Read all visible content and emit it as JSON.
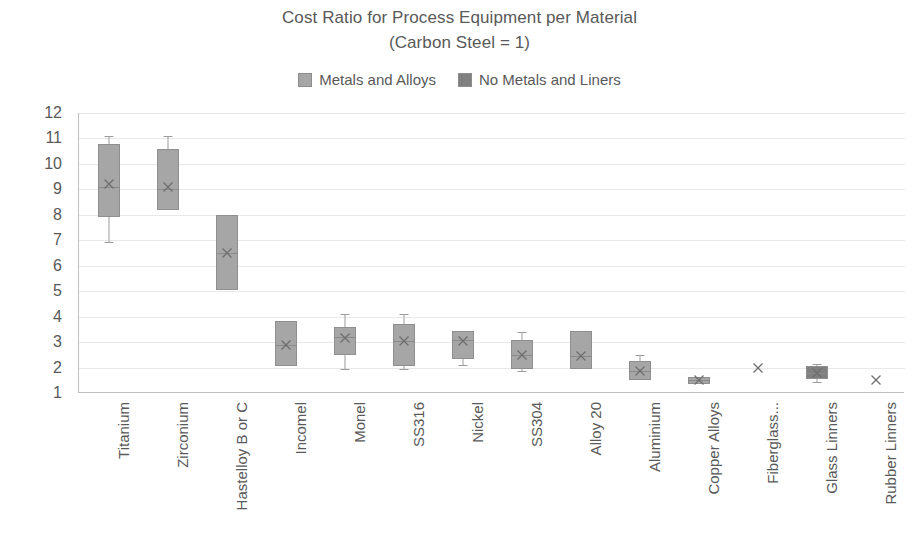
{
  "chart_data": {
    "type": "box",
    "title": "Cost Ratio for Process Equipment per Material",
    "subtitle": "(Carbon Steel = 1)",
    "xlabel": "",
    "ylabel": "",
    "ylim": [
      1,
      12
    ],
    "yticks": [
      1,
      2,
      3,
      4,
      5,
      6,
      7,
      8,
      9,
      10,
      11,
      12
    ],
    "grid": true,
    "legend_position": "top",
    "legend": [
      {
        "label": "Metals and Alloys",
        "color": "#a6a6a6"
      },
      {
        "label": "No Metals and Liners",
        "color": "#808080"
      }
    ],
    "categories": [
      "Titanium",
      "Zirconium",
      "Hastelloy B or C",
      "Incomel",
      "Monel",
      "SS316",
      "Nickel",
      "SS304",
      "Alloy 20",
      "Aluminium",
      "Copper Alloys",
      "Fiberglass...",
      "Glass Linners",
      "Rubber Linners"
    ],
    "boxes": [
      {
        "name": "Titanium",
        "series": "Metals and Alloys",
        "min": 6.95,
        "q1": 7.9,
        "median": 9.1,
        "mean": 9.2,
        "q3": 10.8,
        "max": 11.1
      },
      {
        "name": "Zirconium",
        "series": "Metals and Alloys",
        "min": 8.2,
        "q1": 8.2,
        "median": 9.0,
        "mean": 9.1,
        "q3": 10.6,
        "max": 11.1
      },
      {
        "name": "Hastelloy B or C",
        "series": "Metals and Alloys",
        "min": 5.05,
        "q1": 5.05,
        "median": 6.5,
        "mean": 6.5,
        "q3": 8.0,
        "max": 8.0
      },
      {
        "name": "Incomel",
        "series": "Metals and Alloys",
        "min": 2.05,
        "q1": 2.05,
        "median": 2.9,
        "mean": 2.9,
        "q3": 3.82,
        "max": 3.82
      },
      {
        "name": "Monel",
        "series": "Metals and Alloys",
        "min": 1.95,
        "q1": 2.5,
        "median": 3.2,
        "mean": 3.15,
        "q3": 3.6,
        "max": 4.1
      },
      {
        "name": "SS316",
        "series": "Metals and Alloys",
        "min": 1.95,
        "q1": 2.05,
        "median": 3.05,
        "mean": 3.05,
        "q3": 3.7,
        "max": 4.1
      },
      {
        "name": "Nickel",
        "series": "Metals and Alloys",
        "min": 2.1,
        "q1": 2.35,
        "median": 3.1,
        "mean": 3.05,
        "q3": 3.42,
        "max": 3.45
      },
      {
        "name": "SS304",
        "series": "Metals and Alloys",
        "min": 1.85,
        "q1": 1.95,
        "median": 2.5,
        "mean": 2.5,
        "q3": 3.1,
        "max": 3.4
      },
      {
        "name": "Alloy 20",
        "series": "Metals and Alloys",
        "min": 1.95,
        "q1": 1.95,
        "median": 2.45,
        "mean": 2.45,
        "q3": 3.45,
        "max": 3.45
      },
      {
        "name": "Aluminium",
        "series": "Metals and Alloys",
        "min": 1.5,
        "q1": 1.5,
        "median": 1.85,
        "mean": 1.85,
        "q3": 2.25,
        "max": 2.5
      },
      {
        "name": "Copper Alloys",
        "series": "Metals and Alloys",
        "min": 1.45,
        "q1": 1.45,
        "median": 1.53,
        "mean": 1.53,
        "q3": 1.62,
        "max": 1.62
      },
      {
        "name": "Fiberglass...",
        "series": "No Metals and Liners",
        "min": 2.0,
        "q1": 2.0,
        "median": 2.0,
        "mean": 2.0,
        "q3": 2.0,
        "max": 2.0
      },
      {
        "name": "Glass Linners",
        "series": "No Metals and Liners",
        "min": 1.45,
        "q1": 1.55,
        "median": 1.8,
        "mean": 1.8,
        "q3": 2.05,
        "max": 2.12
      },
      {
        "name": "Rubber Linners",
        "series": "No Metals and Liners",
        "min": 1.5,
        "q1": 1.5,
        "median": 1.5,
        "mean": 1.5,
        "q3": 1.5,
        "max": 1.5
      }
    ]
  }
}
